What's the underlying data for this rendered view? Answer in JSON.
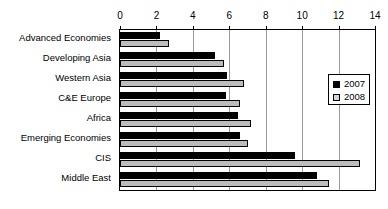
{
  "chart_data": {
    "type": "bar",
    "orientation": "horizontal",
    "title": "",
    "subtitle": "",
    "xlabel": "",
    "ylabel": "",
    "xlim": [
      0,
      14
    ],
    "xticks": [
      0,
      2,
      4,
      6,
      8,
      10,
      12,
      14
    ],
    "xtick_labels": [
      "0",
      "2",
      "4",
      "6",
      "8",
      "10",
      "12",
      "14"
    ],
    "grid": "vertical",
    "legend_position": "right-inside",
    "categories": [
      "Advanced Economies",
      "Developing Asia",
      "Western Asia",
      "C&E Europe",
      "Africa",
      "Emerging Economies",
      "CIS",
      "Middle East"
    ],
    "series": [
      {
        "name": "2007",
        "color": "#000000",
        "values": [
          2.2,
          5.2,
          5.9,
          5.8,
          6.5,
          6.6,
          9.6,
          10.8
        ]
      },
      {
        "name": "2008",
        "color": "#bcbcbc",
        "values": [
          2.7,
          5.7,
          6.8,
          6.6,
          7.2,
          7.0,
          13.2,
          11.5
        ]
      }
    ]
  },
  "legend": {
    "items": [
      {
        "label": "2007",
        "swatch": "black-square-icon"
      },
      {
        "label": "2008",
        "swatch": "gray-square-icon"
      }
    ]
  },
  "colors": {
    "series_2007": "#000000",
    "series_2008": "#bcbcbc",
    "gridline": "#9a9a9a",
    "axis": "#000000",
    "background": "#ffffff"
  }
}
